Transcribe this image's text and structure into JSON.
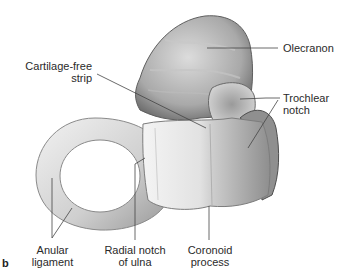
{
  "figure": {
    "panel_letter": "b",
    "labels": {
      "olecranon": "Olecranon",
      "cartilage_free_strip_1": "Cartilage-free",
      "cartilage_free_strip_2": "strip",
      "trochlear_notch_1": "Trochlear",
      "trochlear_notch_2": "notch",
      "anular_ligament_1": "Anular",
      "anular_ligament_2": "ligament",
      "radial_notch_1": "Radial notch",
      "radial_notch_2": "of ulna",
      "coronoid_process_1": "Coronoid",
      "coronoid_process_2": "process"
    },
    "colors": {
      "bone_light": "#e9e9e9",
      "bone_mid": "#bdbdbd",
      "bone_dark": "#7a7a7a",
      "leader_line": "#444444"
    }
  }
}
